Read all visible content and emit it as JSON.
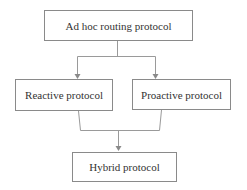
{
  "diagram": {
    "nodes": {
      "root": "Ad hoc routing protocol",
      "reactive": "Reactive protocol",
      "proactive": "Proactive protocol",
      "hybrid": "Hybrid protocol"
    },
    "edges": [
      {
        "from": "root",
        "to": "reactive"
      },
      {
        "from": "root",
        "to": "proactive"
      },
      {
        "from": "reactive",
        "to": "hybrid"
      },
      {
        "from": "proactive",
        "to": "hybrid"
      }
    ],
    "line_color": "#8a8a8a"
  }
}
